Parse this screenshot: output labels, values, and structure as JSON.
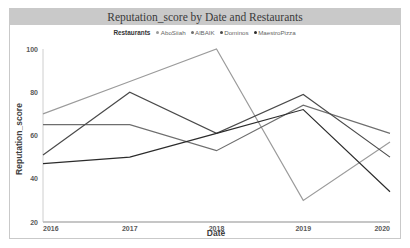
{
  "chart_title": "Reputation_score by Date and Restaurants",
  "legend": {
    "title": "Restaurants",
    "items": [
      {
        "label": "AboSiiah",
        "color": "#9b9b9b"
      },
      {
        "label": "AlBAIK",
        "color": "#6e6e6e"
      },
      {
        "label": "Dominos",
        "color": "#4a4a4a"
      },
      {
        "label": "MaestroPizza",
        "color": "#2b2b2b"
      }
    ]
  },
  "axes": {
    "x_title": "Date",
    "y_title": "Reputation_score",
    "x_ticks": [
      "2016",
      "2017",
      "2018",
      "2019",
      "2020"
    ],
    "y_ticks": [
      "20",
      "40",
      "60",
      "80",
      "100"
    ]
  },
  "chart_data": {
    "type": "line",
    "title": "Reputation_score by Date and Restaurants",
    "xlabel": "Date",
    "ylabel": "Reputation_score",
    "categories": [
      "2016",
      "2017",
      "2018",
      "2019",
      "2020"
    ],
    "x": [
      2016,
      2017,
      2018,
      2019,
      2020
    ],
    "ylim": [
      20,
      100
    ],
    "xlim": [
      2016,
      2020
    ],
    "grid": false,
    "legend_position": "top",
    "series": [
      {
        "name": "AboSiiah",
        "color": "#9b9b9b",
        "values": [
          70,
          85,
          100,
          30,
          57
        ]
      },
      {
        "name": "AlBAIK",
        "color": "#6e6e6e",
        "values": [
          65,
          65,
          53,
          74,
          61
        ]
      },
      {
        "name": "Dominos",
        "color": "#4a4a4a",
        "values": [
          51,
          80,
          61,
          79,
          50
        ]
      },
      {
        "name": "MaestroPizza",
        "color": "#2b2b2b",
        "values": [
          47,
          50,
          61,
          72,
          34
        ]
      }
    ]
  }
}
